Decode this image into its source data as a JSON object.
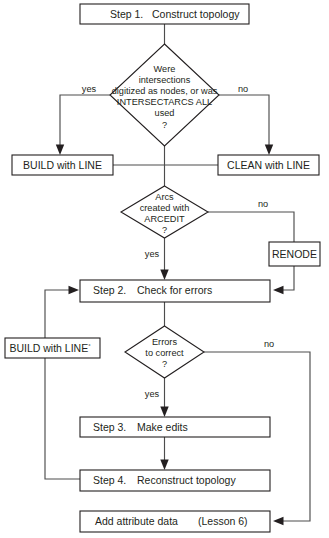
{
  "diagram": {
    "type": "flowchart",
    "colors": {
      "background": "#ffffff",
      "node_stroke": "#231f20",
      "node_fill": "#ffffff",
      "connector": "#4d4d4d",
      "text": "#231f20"
    }
  },
  "nodes": {
    "step1": {
      "shape": "process",
      "label_step": "Step 1.",
      "label_text": "Construct topology"
    },
    "decision1": {
      "shape": "decision",
      "lines": [
        "Were",
        "intersections",
        "digitized as nodes, or was",
        "INTERSECTARCS ALL",
        "used",
        "?"
      ]
    },
    "build_line_top": {
      "shape": "process",
      "label": "BUILD with LINE"
    },
    "clean_line": {
      "shape": "process",
      "label": "CLEAN with LINE"
    },
    "decision2": {
      "shape": "decision",
      "lines": [
        "Arcs",
        "created with",
        "ARCEDIT",
        "?"
      ]
    },
    "renode": {
      "shape": "process",
      "label": "RENODE"
    },
    "step2": {
      "shape": "process",
      "label_step": "Step 2.",
      "label_text": "Check for errors"
    },
    "decision3": {
      "shape": "decision",
      "lines": [
        "Errors",
        "to correct",
        "?"
      ]
    },
    "build_line_left": {
      "shape": "process",
      "label": "BUILD with LINE",
      "superscript": "°"
    },
    "step3": {
      "shape": "process",
      "label_step": "Step 3.",
      "label_text": "Make edits"
    },
    "step4": {
      "shape": "process",
      "label_step": "Step 4.",
      "label_text": "Reconstruct topology"
    },
    "add_attribute": {
      "shape": "process",
      "label_text": "Add attribute data",
      "label_note": "(Lesson 6)"
    }
  },
  "edge_labels": {
    "d1_yes": "yes",
    "d1_no": "no",
    "d2_no": "no",
    "d2_yes": "yes",
    "d3_no": "no",
    "d3_yes": "yes"
  }
}
